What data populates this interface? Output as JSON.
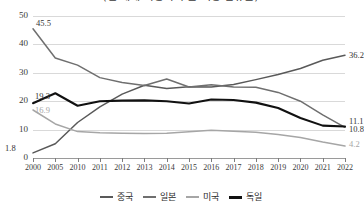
{
  "chart_data": {
    "type": "line",
    "title": "(전 세계 자동차 수출 시장 점유율)",
    "xlabel": "",
    "ylabel": "",
    "x": [
      "2000",
      "2005",
      "2010",
      "2011",
      "2012",
      "2013",
      "2014",
      "2015",
      "2016",
      "2017",
      "2018",
      "2019",
      "2020",
      "2021",
      "2022"
    ],
    "ylim": [
      0,
      50
    ],
    "yticks": [
      "0",
      "10",
      "20",
      "30",
      "40",
      "50"
    ],
    "grid": true,
    "legend_position": "bottom",
    "series": [
      {
        "name": "중국",
        "color": "#595959",
        "values": [
          1.8,
          5.0,
          12.5,
          18.0,
          22.5,
          25.6,
          24.5,
          25.1,
          25.0,
          25.9,
          27.6,
          29.4,
          31.5,
          34.4,
          36.2
        ]
      },
      {
        "name": "일본",
        "color": "#6f6f6f",
        "values": [
          45.5,
          35.2,
          32.7,
          28.3,
          26.6,
          25.5,
          27.8,
          25.0,
          25.8,
          25.0,
          24.9,
          23.1,
          20.0,
          15.2,
          10.8
        ]
      },
      {
        "name": "미국",
        "color": "#a6a6a6",
        "values": [
          16.9,
          12.0,
          9.3,
          8.9,
          8.7,
          8.6,
          8.7,
          9.2,
          9.8,
          9.4,
          9.1,
          8.3,
          7.2,
          5.6,
          4.2
        ]
      },
      {
        "name": "독일",
        "color": "#111111",
        "values": [
          19.3,
          22.8,
          18.4,
          20.0,
          20.2,
          20.3,
          20.0,
          19.2,
          20.6,
          20.4,
          19.5,
          17.6,
          14.1,
          11.4,
          11.1
        ]
      }
    ],
    "point_labels": [
      {
        "text": "45.5",
        "series": "일본",
        "x": "2000",
        "value": 45.5,
        "side": "left"
      },
      {
        "text": "19.3",
        "series": "독일",
        "x": "2000",
        "value": 19.3,
        "side": "left"
      },
      {
        "text": "16.9",
        "series": "미국",
        "x": "2000",
        "value": 16.9,
        "side": "left"
      },
      {
        "text": "1.8",
        "series": "중국",
        "x": "2000",
        "value": 1.8,
        "side": "left"
      },
      {
        "text": "36.2",
        "series": "중국",
        "x": "2022",
        "value": 36.2,
        "side": "right"
      },
      {
        "text": "11.1",
        "series": "독일",
        "x": "2022",
        "value": 11.1,
        "side": "right"
      },
      {
        "text": "10.8",
        "series": "일본",
        "x": "2022",
        "value": 10.8,
        "side": "right"
      },
      {
        "text": "4.2",
        "series": "미국",
        "x": "2022",
        "value": 4.2,
        "side": "right"
      }
    ]
  },
  "legend": {
    "items": [
      {
        "label": "중국",
        "color": "#595959"
      },
      {
        "label": "일본",
        "color": "#6f6f6f"
      },
      {
        "label": "미국",
        "color": "#a6a6a6"
      },
      {
        "label": "독일",
        "color": "#111111"
      }
    ]
  }
}
